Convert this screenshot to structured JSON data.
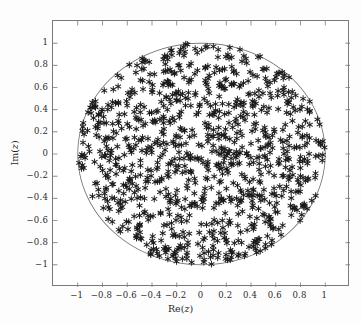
{
  "chart_data": {
    "type": "scatter",
    "title": "",
    "subtitle": "",
    "xlabel": "Re(z)",
    "ylabel": "Im(z)",
    "xlim": [
      -1.2,
      1.2
    ],
    "ylim": [
      -1.2,
      1.2
    ],
    "xticks": [
      -1,
      -0.8,
      -0.6,
      -0.4,
      -0.2,
      0,
      0.2,
      0.4,
      0.6,
      0.8,
      1
    ],
    "yticks": [
      1,
      0.8,
      0.6,
      0.4,
      0.2,
      0,
      -0.2,
      -0.4,
      -0.6,
      -0.8,
      -1
    ],
    "xtick_labels": [
      "−1",
      "−0.8",
      "−0.6",
      "−0.4",
      "−0.2",
      "0",
      "0.2",
      "0.4",
      "0.6",
      "0.8",
      "1"
    ],
    "ytick_labels": [
      "1",
      "0.8",
      "0.6",
      "0.4",
      "0.2",
      "0",
      "−0.2",
      "−0.4",
      "−0.6",
      "−0.8",
      "−1"
    ],
    "grid": false,
    "legend": null,
    "legend_position": "none",
    "frame": true,
    "tick_direction": "in",
    "series": [
      {
        "name": "z samples",
        "marker": "asterisk",
        "marker_color": "#1a1a1a",
        "marker_size": 3.4,
        "n_points": 1000,
        "description": "1000 points uniformly distributed inside the unit disc |z| <= 1 of the complex plane",
        "distribution": "uniform-in-disc",
        "radius_max": 1.0
      },
      {
        "name": "unit circle",
        "type": "line",
        "line_color": "#6e6e6e",
        "line_width": 0.8,
        "description": "boundary curve |z| = 1",
        "radius": 1.0
      }
    ],
    "annotations": [],
    "colors": {
      "marker": "#1a1a1a",
      "circle": "#6e6e6e",
      "frame": "#7a7a7a",
      "text": "#2b2b2b",
      "background": "#ffffff",
      "figure_background": "#fdfdfd"
    }
  },
  "axes": {
    "x_title": "Re(z)",
    "x_title_prefix": "Re(",
    "x_title_var": "z",
    "x_title_suffix": ")",
    "y_title": "Im(z)",
    "y_title_prefix": "Im(",
    "y_title_var": "z",
    "y_title_suffix": ")"
  }
}
